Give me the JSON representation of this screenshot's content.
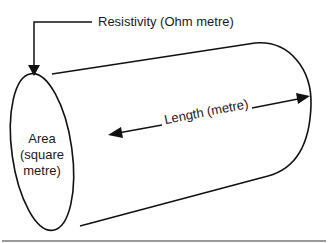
{
  "diagram": {
    "type": "labeled cylinder conductor",
    "labels": {
      "resistivity": "Resistivity (Ohm metre)",
      "length": "Length (metre)",
      "area_line1": "Area",
      "area_line2": "(square",
      "area_line3": "metre)"
    },
    "colors": {
      "stroke": "#111111",
      "background": "#ffffff",
      "divider": "#777777"
    }
  }
}
